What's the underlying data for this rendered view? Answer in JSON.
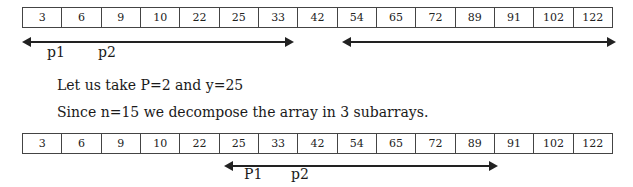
{
  "arrays": [
    {
      "values": [
        "3",
        "6",
        "9",
        "10",
        "22",
        "25",
        "33",
        "42",
        "54",
        "65",
        "72",
        "89",
        "91",
        "102",
        "122"
      ]
    },
    {
      "values": [
        "3",
        "6",
        "9",
        "10",
        "22",
        "25",
        "33",
        "42",
        "54",
        "65",
        "72",
        "89",
        "91",
        "102",
        "122"
      ]
    }
  ],
  "labels": {
    "top_p1": "p1",
    "top_p2": "p2",
    "bottom_p1": "P1",
    "bottom_p2": "p2"
  },
  "text": {
    "line1": "Let us take P=2 and y=25",
    "line2": "Since n=15 we decompose the array in 3 subarrays."
  }
}
